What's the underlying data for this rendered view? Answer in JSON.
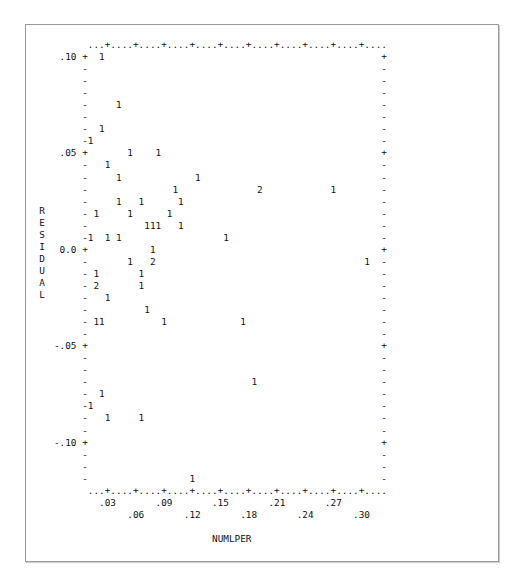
{
  "chart_data": {
    "type": "scatter",
    "title": "",
    "xlabel": "NUMLPER",
    "ylabel": "RESIDUAL",
    "x_ticks_top_row": [
      ".03",
      ".09",
      ".15",
      ".21",
      ".27"
    ],
    "x_ticks_bottom_row": [
      ".06",
      ".12",
      ".18",
      ".24",
      ".30"
    ],
    "y_ticks": [
      ".10",
      ".05",
      "0.0",
      "-.05",
      "-.10"
    ],
    "xlim": [
      0.012,
      0.324
    ],
    "ylim": [
      -0.12,
      0.1
    ],
    "grid": false,
    "legend": "plot symbols are counts of observations at each position",
    "points": [
      {
        "x": 0.03,
        "y": 0.1,
        "count": 1
      },
      {
        "x": 0.048,
        "y": 0.075,
        "count": 1
      },
      {
        "x": 0.03,
        "y": 0.0625,
        "count": 1
      },
      {
        "x": 0.018,
        "y": 0.0563,
        "count": 1
      },
      {
        "x": 0.06,
        "y": 0.05,
        "count": 1
      },
      {
        "x": 0.09,
        "y": 0.05,
        "count": 1
      },
      {
        "x": 0.036,
        "y": 0.0438,
        "count": 1
      },
      {
        "x": 0.048,
        "y": 0.0375,
        "count": 1
      },
      {
        "x": 0.132,
        "y": 0.0375,
        "count": 1
      },
      {
        "x": 0.108,
        "y": 0.0313,
        "count": 1
      },
      {
        "x": 0.198,
        "y": 0.0313,
        "count": 2
      },
      {
        "x": 0.048,
        "y": 0.025,
        "count": 1
      },
      {
        "x": 0.072,
        "y": 0.025,
        "count": 1
      },
      {
        "x": 0.114,
        "y": 0.025,
        "count": 1
      },
      {
        "x": 0.276,
        "y": 0.025,
        "count": 1
      },
      {
        "x": 0.024,
        "y": 0.0188,
        "count": 1
      },
      {
        "x": 0.06,
        "y": 0.0188,
        "count": 1
      },
      {
        "x": 0.102,
        "y": 0.0188,
        "count": 1
      },
      {
        "x": 0.078,
        "y": 0.0125,
        "count": 1
      },
      {
        "x": 0.084,
        "y": 0.0125,
        "count": 1
      },
      {
        "x": 0.09,
        "y": 0.0125,
        "count": 1
      },
      {
        "x": 0.114,
        "y": 0.0125,
        "count": 1
      },
      {
        "x": 0.018,
        "y": 0.0063,
        "count": 1
      },
      {
        "x": 0.036,
        "y": 0.0063,
        "count": 1
      },
      {
        "x": 0.048,
        "y": 0.0063,
        "count": 1
      },
      {
        "x": 0.162,
        "y": 0.0063,
        "count": 1
      },
      {
        "x": 0.084,
        "y": 0.0,
        "count": 1
      },
      {
        "x": 0.06,
        "y": -0.0063,
        "count": 1
      },
      {
        "x": 0.084,
        "y": -0.0063,
        "count": 2
      },
      {
        "x": 0.312,
        "y": -0.0063,
        "count": 1
      },
      {
        "x": 0.024,
        "y": -0.0125,
        "count": 1
      },
      {
        "x": 0.072,
        "y": -0.0125,
        "count": 1
      },
      {
        "x": 0.024,
        "y": -0.0188,
        "count": 2
      },
      {
        "x": 0.072,
        "y": -0.0188,
        "count": 1
      },
      {
        "x": 0.036,
        "y": -0.025,
        "count": 1
      },
      {
        "x": 0.078,
        "y": -0.0313,
        "count": 1
      },
      {
        "x": 0.024,
        "y": -0.0375,
        "count": 1
      },
      {
        "x": 0.03,
        "y": -0.0375,
        "count": 1
      },
      {
        "x": 0.096,
        "y": -0.0375,
        "count": 1
      },
      {
        "x": 0.18,
        "y": -0.0375,
        "count": 1
      },
      {
        "x": 0.192,
        "y": -0.0688,
        "count": 1
      },
      {
        "x": 0.03,
        "y": -0.075,
        "count": 1
      },
      {
        "x": 0.018,
        "y": -0.0813,
        "count": 1
      },
      {
        "x": 0.036,
        "y": -0.0875,
        "count": 1
      },
      {
        "x": 0.072,
        "y": -0.0875,
        "count": 1
      },
      {
        "x": 0.126,
        "y": -0.1188,
        "count": 1
      }
    ]
  },
  "plot": {
    "lines": [
      "         ...+....+....+....+....+....+....+....+....+....+....",
      "    .10 +  1                                                 +",
      "        -                                                    -",
      "        -                                                    -",
      "        -                                                    -",
      "        -     1                                              -",
      "        -                                                    -",
      "        -  1                                                 -",
      "        -1                                                   -",
      "    .05 +       1    1                                       +",
      "        -   1                                                -",
      "        -     1             1                                -",
      "        -               1              2            1        -",
      "        -     1   1      1                                   -",
      "        - 1     1      1                                     -",
      "        -          111   1                                   -",
      "        -1  1 1                  1                           -",
      "    0.0 +           1                                        +",
      "        -       1   2                                     1  -",
      "        - 1       1                                          -",
      "        - 2       1                                          -",
      "        -   1                                                -",
      "        -          1                                         -",
      "        - 11          1             1                        -",
      "        -                                                    -",
      "   -.05 +                                                    +",
      "        -                                                    -",
      "        -                                                    -",
      "        -                             1                      -",
      "        -  1                                                 -",
      "        -1                                                   -",
      "        -   1     1                                          -",
      "        -                                                    -",
      "   -.10 +                                                    +",
      "        -                                                    -",
      "        -                                                    -",
      "        -                  1                                 -",
      "         ...+....+....+....+....+....+....+....+....+....+....",
      "           .03       .09       .15       .21       .27",
      "                .06       .12       .18       .24       .30"
    ]
  },
  "ylabel_chars": "R\nE\nS\nI\nD\nU\nA\nL",
  "xlabel": "NUMLPER"
}
